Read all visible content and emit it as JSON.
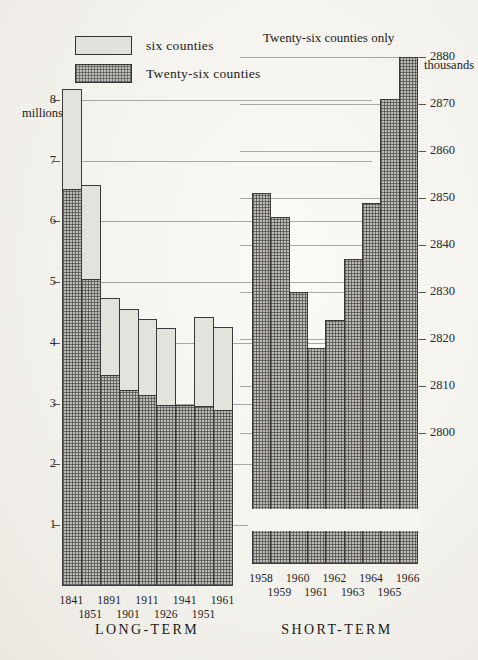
{
  "legend": {
    "items": [
      {
        "key": "six",
        "label": "six counties",
        "fill": "light"
      },
      {
        "key": "twentysix",
        "label": "Twenty-six counties",
        "fill": "dark"
      }
    ]
  },
  "left_panel": {
    "caption": "",
    "title": "LONG-TERM",
    "unit_label": "millions"
  },
  "right_panel": {
    "caption": "Twenty-six counties only",
    "title": "SHORT-TERM",
    "unit_label": "thousands"
  },
  "chart_data": [
    {
      "type": "bar",
      "id": "long-term",
      "title": "LONG-TERM",
      "stacked": true,
      "xlabel": "",
      "ylabel": "millions",
      "ylim": [
        0,
        8.4
      ],
      "yticks": [
        1,
        2,
        3,
        4,
        5,
        6,
        7,
        8
      ],
      "ytick_labels": [
        "1",
        "2",
        "3",
        "4",
        "5",
        "6",
        "7",
        "8"
      ],
      "grid": true,
      "legend_position": "top-left",
      "categories": [
        "1841",
        "1851",
        "1891",
        "1901",
        "1911",
        "1926",
        "1941",
        "1951",
        "1961"
      ],
      "series": [
        {
          "name": "Twenty-six counties",
          "fill": "dark",
          "values": [
            6.53,
            5.05,
            3.47,
            3.22,
            3.14,
            2.97,
            2.97,
            2.96,
            2.9
          ]
        },
        {
          "name": "six counties",
          "fill": "light",
          "values": [
            1.65,
            1.55,
            1.27,
            1.33,
            1.25,
            1.28,
            0.0,
            1.46,
            1.36
          ]
        }
      ],
      "totals": [
        8.18,
        6.6,
        4.74,
        4.55,
        4.39,
        4.25,
        2.97,
        4.42,
        4.26
      ]
    },
    {
      "type": "bar",
      "id": "short-term",
      "title": "SHORT-TERM",
      "stacked": false,
      "xlabel": "",
      "ylabel": "thousands",
      "ylim": [
        2795,
        2884
      ],
      "yticks": [
        2800,
        2810,
        2820,
        2830,
        2840,
        2850,
        2860,
        2870,
        2880
      ],
      "ytick_labels": [
        "2800",
        "2810",
        "2820",
        "2830",
        "2840",
        "2850",
        "2860",
        "2870",
        "2880"
      ],
      "grid": true,
      "axis_break": true,
      "annotation": "Twenty-six counties only",
      "categories": [
        "1958",
        "1959",
        "1960",
        "1961",
        "1962",
        "1963",
        "1964",
        "1965",
        "1966"
      ],
      "series": [
        {
          "name": "Twenty-six counties",
          "fill": "dark",
          "values": [
            2851,
            2846,
            2830,
            2818,
            2824,
            2837,
            2849,
            2871,
            2880
          ]
        }
      ]
    }
  ]
}
